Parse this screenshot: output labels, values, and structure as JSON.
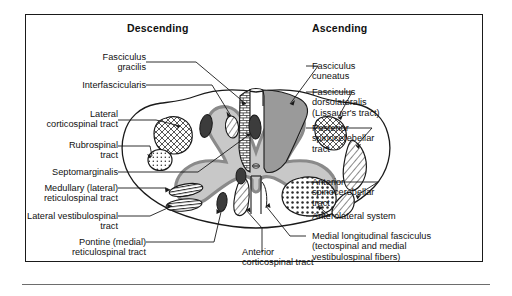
{
  "figure": {
    "title_descending": "Descending",
    "title_ascending": "Ascending"
  },
  "headers": {
    "left": "Descending",
    "right": "Ascending"
  },
  "labels_left": [
    {
      "id": "fasciculus-gracilis",
      "lines": [
        "Fasciculus",
        "gracilis"
      ]
    },
    {
      "id": "interfascicularis",
      "lines": [
        "Interfascicularis"
      ]
    },
    {
      "id": "lateral-corticospinal",
      "lines": [
        "Lateral",
        "corticospinal tract"
      ]
    },
    {
      "id": "rubrospinal",
      "lines": [
        "Rubrospinal",
        "tract"
      ]
    },
    {
      "id": "septomarginalis",
      "lines": [
        "Septomarginalis"
      ]
    },
    {
      "id": "medullary-reticulospinal",
      "lines": [
        "Medullary (lateral)",
        "reticulospinal tract"
      ]
    },
    {
      "id": "lateral-vestibulospinal",
      "lines": [
        "Lateral vestibulospinal",
        "tract"
      ]
    },
    {
      "id": "pontine-reticulospinal",
      "lines": [
        "Pontine (medial)",
        "reticulospinal tract"
      ]
    }
  ],
  "labels_right": [
    {
      "id": "fasciculus-cuneatus",
      "lines": [
        "Fasciculus",
        "cuneatus"
      ]
    },
    {
      "id": "fasciculus-dorsolateralis",
      "lines": [
        "Fasciculus",
        "dorsolateralis",
        "(Lissauer's tract)"
      ]
    },
    {
      "id": "posterior-spinocerebellar",
      "lines": [
        "Posterior",
        "spinocerebellar",
        "tract"
      ]
    },
    {
      "id": "anterior-spinocerebellar",
      "lines": [
        "Anterior",
        "spinocerebellar",
        "tract"
      ]
    },
    {
      "id": "anterolateral-system",
      "lines": [
        "Anterolateral system"
      ]
    },
    {
      "id": "medial-longitudinal-fasciculus",
      "lines": [
        "Medial longitudinal fasciculus",
        "(tectospinal and medial",
        "vestibulospinal fibers)"
      ]
    }
  ],
  "labels_bottom": [
    {
      "id": "anterior-corticospinal",
      "lines": [
        "Anterior",
        "corticospinal tract"
      ]
    }
  ],
  "colors": {
    "ink": "#111111",
    "frame": "#1a1a1a",
    "rule": "#6d6d6d",
    "gray_matter_fill": "#c8c8c8",
    "gray_matter_edge": "#8a8a8a",
    "cuneatus_fill": "#9a9a9a",
    "dark_tract": "#3c3c3c",
    "background": "#ffffff"
  }
}
